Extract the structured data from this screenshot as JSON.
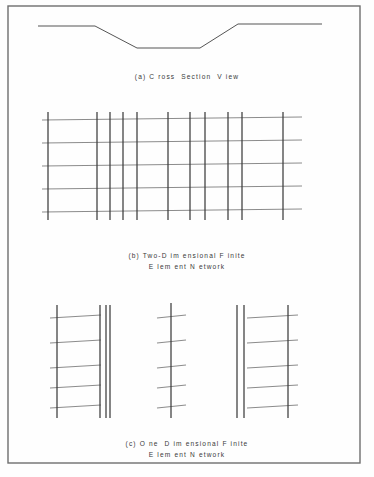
{
  "figure": {
    "background_color": "#fefefe",
    "frame": {
      "name": "figure-border",
      "x": 8,
      "y": 6,
      "width": 352,
      "height": 457,
      "stroke": "#6e6e6e",
      "stroke_width": 1.4
    },
    "panels": [
      {
        "id": "cross-section",
        "label": "a",
        "caption": "(a) C ross  Section  V iew",
        "caption_lines": [
          "(a) C ross  Section  V iew"
        ],
        "caption_x": 187,
        "caption_y": 79,
        "caption_line_height": 11,
        "type": "polyline",
        "stroke": "#555555",
        "stroke_width": 1.0,
        "points": [
          [
            38,
            26
          ],
          [
            95,
            26
          ],
          [
            137,
            48
          ],
          [
            200,
            48
          ],
          [
            238,
            24
          ],
          [
            322,
            24
          ]
        ]
      },
      {
        "id": "two-dimensional-network",
        "label": "b",
        "caption_lines": [
          "(b) Two-D im ensional F inite",
          "E lem ent N etwork"
        ],
        "caption_x": 187,
        "caption_y": 258,
        "caption_line_height": 11,
        "type": "grid",
        "vertical_stroke": "#3c3c3c",
        "vertical_stroke_width": 1.25,
        "horizontal_stroke": "#8c8c8c",
        "horizontal_stroke_width": 1.1,
        "vertical_x": [
          48,
          97,
          110,
          123,
          137,
          168,
          190,
          205,
          228,
          242,
          283
        ],
        "vertical_y_top": 112,
        "vertical_y_bottom": 220,
        "horizontal_y": [
          120,
          143,
          166,
          189,
          212
        ],
        "horizontal_x_left": 42,
        "horizontal_x_right": 302,
        "horizontal_tilt": -3
      },
      {
        "id": "one-dimensional-network",
        "label": "c",
        "caption_lines": [
          "(c) O ne  D im ensional F inite",
          "E lem ent N etwork"
        ],
        "caption_x": 187,
        "caption_y": 446,
        "caption_line_height": 11,
        "type": "ladders",
        "vertical_stroke": "#3c3c3c",
        "vertical_stroke_width": 1.25,
        "rung_stroke": "#8c8c8c",
        "rung_stroke_width": 1.1,
        "rung_y": [
          318,
          343,
          368,
          388,
          408
        ],
        "rung_tilt": -3,
        "groups": [
          {
            "id": "ladder-left",
            "vertical_x": [
              57,
              100,
              106,
              110
            ],
            "vertical_y_top": 305,
            "vertical_y_bottom": 418,
            "rung_x_left": 50,
            "rung_x_right": 101
          },
          {
            "id": "ladder-middle",
            "vertical_x": [
              171
            ],
            "vertical_y_top": 303,
            "vertical_y_bottom": 418,
            "rung_x_left": 157,
            "rung_x_right": 186
          },
          {
            "id": "ladder-right",
            "vertical_x": [
              237,
              244,
              288
            ],
            "vertical_y_top": 305,
            "vertical_y_bottom": 418,
            "rung_x_left": 247,
            "rung_x_right": 298
          }
        ]
      }
    ]
  },
  "chart_data": {
    "type": "diagram",
    "panels": [
      {
        "label": "(a)",
        "name": "Cross Section View",
        "description": "Trapezoidal channel ground profile drawn as a single polyline",
        "vertices": [
          [
            38,
            26
          ],
          [
            95,
            26
          ],
          [
            137,
            48
          ],
          [
            200,
            48
          ],
          [
            238,
            24
          ],
          [
            322,
            24
          ]
        ],
        "left_bank_elevation": 26,
        "channel_bed_elevation": 48,
        "right_bank_elevation": 24
      },
      {
        "label": "(b)",
        "name": "Two-Dimensional Finite Element Network",
        "description": "Rectangular mesh with non-uniform vertical spacing, densest near the channel",
        "vertical_line_count": 11,
        "horizontal_line_count": 5,
        "vertical_x": [
          48,
          97,
          110,
          123,
          137,
          168,
          190,
          205,
          228,
          242,
          283
        ],
        "horizontal_y": [
          120,
          143,
          166,
          189,
          212
        ]
      },
      {
        "label": "(c)",
        "name": "One Dimensional Finite Element Network",
        "description": "Three vertical element columns, each with five cross members",
        "group_count": 3,
        "rungs_per_group": 5,
        "group_vertical_counts": [
          4,
          1,
          3
        ]
      }
    ]
  }
}
